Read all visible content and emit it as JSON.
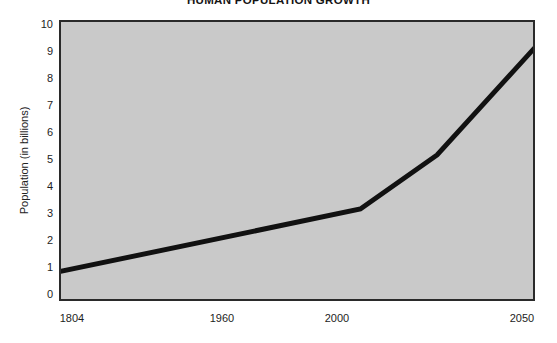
{
  "chart_data": {
    "type": "line",
    "title": "HUMAN POPULATION GROWTH",
    "xlabel": "",
    "ylabel": "Population (in billions)",
    "x": [
      1804,
      1960,
      2000,
      2050
    ],
    "values": [
      1.0,
      3.25,
      5.2,
      9.0
    ],
    "series": [
      {
        "name": "World population",
        "x": [
          1804,
          1960,
          2000,
          2050
        ],
        "values": [
          1.0,
          3.25,
          5.2,
          9.0
        ]
      }
    ],
    "xlim": [
      1804,
      2050
    ],
    "ylim": [
      0,
      10
    ],
    "y_ticks": [
      0,
      1,
      2,
      3,
      4,
      5,
      6,
      7,
      8,
      9,
      10
    ],
    "y_tick_labels": [
      "0",
      "1",
      "2",
      "3",
      "4",
      "5",
      "6",
      "7",
      "8",
      "9",
      "10"
    ],
    "x_ticks": [
      1804,
      1960,
      2000,
      2050
    ],
    "x_tick_labels": [
      "1804",
      "1960",
      "2000",
      "2050"
    ],
    "grid": false,
    "legend": "none",
    "line_color": "#111111",
    "plot_background_color": "#c9c9c9",
    "figure_background_color": "#ffffff",
    "axis_border_color": "#2a2a2a"
  },
  "axes": {
    "y_tick_labels": [
      "10",
      "9",
      "8",
      "7",
      "6",
      "5",
      "4",
      "3",
      "2",
      "1",
      "0"
    ],
    "x_tick_labels": [
      "1804",
      "1960",
      "2000",
      "2050"
    ]
  }
}
